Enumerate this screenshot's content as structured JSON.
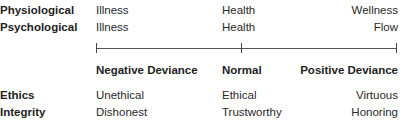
{
  "rows_top": [
    {
      "label": "Physiological",
      "left": "Illness",
      "mid": "Health",
      "right": "Wellness"
    },
    {
      "label": "Psychological",
      "left": "Illness",
      "mid": "Health",
      "right": "Flow"
    }
  ],
  "axis": {
    "left_label": "Negative Deviance",
    "mid_label": "Normal",
    "right_label": "Positive Deviance"
  },
  "rows_bottom": [
    {
      "label": "Ethics",
      "left": "Unethical",
      "mid": "Ethical",
      "right": "Virtuous"
    },
    {
      "label": "Integrity",
      "left": "Dishonest",
      "mid": "Trustworthy",
      "right": "Honoring"
    }
  ]
}
